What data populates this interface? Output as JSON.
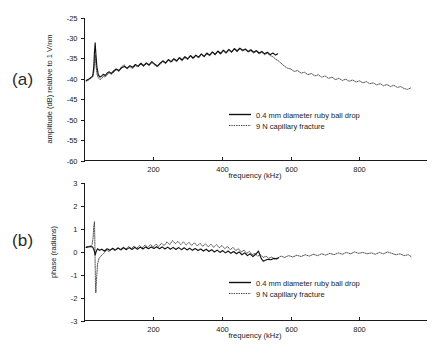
{
  "figure": {
    "panel_a_label": "(a)",
    "panel_b_label": "(b)"
  },
  "legend": {
    "series1": "0.4 mm diameter ruby ball drop",
    "series2": "9 N capillary fracture"
  },
  "chart_data": [
    {
      "type": "line",
      "panel": "(a)",
      "title": "",
      "xlabel": "frequency (kHz)",
      "ylabel": "amplitude (dB) relative to 1 V/nm",
      "xlim": [
        0,
        995
      ],
      "ylim": [
        -60,
        -25
      ],
      "xticks": [
        200,
        400,
        600,
        800
      ],
      "yticks": [
        -25,
        -30,
        -35,
        -40,
        -45,
        -50,
        -55,
        -60
      ],
      "grid": false,
      "legend_position": "lower-right",
      "series": [
        {
          "name": "0.4 mm diameter ruby ball drop",
          "style": "solid",
          "x": [
            5,
            10,
            15,
            20,
            24,
            27,
            29,
            31,
            33,
            36,
            40,
            45,
            50,
            55,
            60,
            66,
            72,
            78,
            85,
            92,
            100,
            108,
            116,
            124,
            132,
            140,
            148,
            156,
            164,
            172,
            180,
            188,
            196,
            204,
            212,
            220,
            228,
            236,
            244,
            252,
            260,
            268,
            276,
            284,
            292,
            300,
            308,
            316,
            324,
            332,
            340,
            348,
            356,
            364,
            372,
            380,
            388,
            396,
            404,
            412,
            420,
            428,
            436,
            444,
            452,
            460,
            468,
            476,
            484,
            492,
            500,
            508,
            516,
            524,
            532,
            540,
            548,
            556,
            562
          ],
          "values": [
            -40.4,
            -40.2,
            -39.9,
            -39.6,
            -39.3,
            -37.2,
            -33.5,
            -31.2,
            -33.8,
            -37.0,
            -39.0,
            -39.6,
            -39.3,
            -38.9,
            -39.2,
            -38.6,
            -38.3,
            -38.7,
            -38.1,
            -37.6,
            -38.0,
            -37.3,
            -37.0,
            -37.4,
            -36.8,
            -37.2,
            -36.5,
            -36.9,
            -36.2,
            -36.8,
            -36.1,
            -36.6,
            -35.8,
            -36.4,
            -36.9,
            -36.2,
            -35.6,
            -36.1,
            -35.3,
            -35.8,
            -35.1,
            -35.6,
            -34.8,
            -35.4,
            -34.6,
            -35.1,
            -34.3,
            -34.9,
            -34.2,
            -34.7,
            -33.9,
            -34.5,
            -33.7,
            -34.2,
            -33.4,
            -34.0,
            -33.2,
            -33.8,
            -33.0,
            -33.6,
            -32.8,
            -33.4,
            -32.6,
            -33.2,
            -32.5,
            -33.0,
            -32.7,
            -33.3,
            -32.9,
            -33.5,
            -33.1,
            -33.7,
            -33.3,
            -33.9,
            -33.5,
            -34.1,
            -33.7,
            -34.2,
            -33.9
          ]
        },
        {
          "name": "9 N capillary fracture",
          "style": "dotted",
          "x": [
            5,
            10,
            15,
            20,
            24,
            27,
            29,
            31,
            33,
            36,
            40,
            45,
            50,
            55,
            60,
            66,
            72,
            78,
            85,
            92,
            100,
            108,
            116,
            124,
            132,
            140,
            148,
            156,
            164,
            172,
            180,
            188,
            196,
            204,
            212,
            220,
            228,
            236,
            244,
            252,
            260,
            268,
            276,
            284,
            292,
            300,
            308,
            316,
            324,
            332,
            340,
            348,
            356,
            364,
            372,
            380,
            388,
            396,
            404,
            412,
            420,
            428,
            436,
            444,
            452,
            460,
            468,
            476,
            484,
            492,
            500,
            508,
            516,
            524,
            532,
            540,
            548,
            556,
            564,
            572,
            580,
            590,
            600,
            610,
            620,
            630,
            640,
            650,
            660,
            670,
            680,
            690,
            700,
            710,
            720,
            730,
            740,
            750,
            760,
            770,
            780,
            790,
            800,
            810,
            820,
            830,
            840,
            850,
            860,
            870,
            880,
            890,
            900,
            910,
            920,
            930,
            940,
            950
          ],
          "values": [
            -40.6,
            -40.4,
            -40.1,
            -39.8,
            -39.5,
            -38.4,
            -36.0,
            -34.2,
            -36.4,
            -38.6,
            -39.8,
            -40.2,
            -39.9,
            -39.4,
            -39.6,
            -39.0,
            -38.6,
            -38.9,
            -38.4,
            -37.8,
            -38.2,
            -37.0,
            -36.6,
            -37.6,
            -37.0,
            -37.5,
            -36.8,
            -37.1,
            -36.4,
            -37.0,
            -36.3,
            -36.8,
            -36.0,
            -36.6,
            -37.1,
            -36.4,
            -35.8,
            -36.3,
            -35.5,
            -36.0,
            -35.3,
            -35.8,
            -35.0,
            -35.6,
            -34.8,
            -35.3,
            -34.5,
            -35.1,
            -34.4,
            -34.9,
            -34.1,
            -34.7,
            -33.9,
            -34.4,
            -33.6,
            -34.2,
            -33.4,
            -34.0,
            -33.2,
            -33.8,
            -33.0,
            -33.6,
            -32.8,
            -33.4,
            -32.7,
            -33.2,
            -32.9,
            -33.5,
            -33.1,
            -33.7,
            -33.3,
            -33.9,
            -33.5,
            -34.1,
            -33.7,
            -34.3,
            -34.6,
            -35.2,
            -35.6,
            -36.2,
            -36.8,
            -37.4,
            -37.6,
            -38.2,
            -38.0,
            -38.6,
            -38.4,
            -39.0,
            -38.7,
            -39.3,
            -39.0,
            -39.6,
            -39.3,
            -39.9,
            -39.6,
            -40.2,
            -39.9,
            -40.4,
            -40.1,
            -40.6,
            -40.3,
            -40.8,
            -40.5,
            -41.0,
            -40.7,
            -41.2,
            -41.0,
            -41.5,
            -41.2,
            -41.7,
            -41.4,
            -41.9,
            -41.6,
            -42.1,
            -41.9,
            -42.4,
            -42.6,
            -42.2
          ]
        }
      ]
    },
    {
      "type": "line",
      "panel": "(b)",
      "title": "",
      "xlabel": "frequency (kHz)",
      "ylabel": "phase (radians)",
      "xlim": [
        0,
        995
      ],
      "ylim": [
        -3,
        3
      ],
      "xticks": [
        200,
        400,
        600,
        800
      ],
      "yticks": [
        3,
        2,
        1,
        0,
        -1,
        -2,
        -3
      ],
      "grid": false,
      "legend_position": "lower-right",
      "series": [
        {
          "name": "0.4 mm diameter ruby ball drop",
          "style": "solid",
          "x": [
            5,
            12,
            18,
            24,
            28,
            31,
            34,
            38,
            44,
            50,
            58,
            66,
            74,
            82,
            90,
            98,
            106,
            114,
            122,
            130,
            138,
            146,
            154,
            162,
            170,
            178,
            186,
            194,
            202,
            210,
            218,
            226,
            234,
            242,
            250,
            258,
            266,
            274,
            282,
            290,
            298,
            306,
            314,
            322,
            330,
            338,
            346,
            354,
            362,
            370,
            378,
            386,
            394,
            402,
            410,
            418,
            426,
            434,
            442,
            450,
            458,
            466,
            474,
            482,
            490,
            498,
            506,
            514,
            520,
            526,
            534,
            542,
            550,
            558,
            564
          ],
          "values": [
            0.18,
            0.2,
            0.22,
            0.19,
            0.05,
            -0.15,
            0.0,
            0.12,
            0.05,
            0.1,
            0.02,
            0.12,
            0.05,
            0.14,
            0.06,
            0.15,
            0.07,
            0.16,
            0.08,
            0.17,
            0.09,
            0.18,
            0.1,
            0.19,
            0.11,
            0.2,
            0.12,
            0.2,
            0.13,
            0.21,
            0.12,
            0.2,
            0.11,
            0.19,
            0.1,
            0.18,
            0.09,
            0.17,
            0.08,
            0.16,
            0.07,
            0.14,
            0.05,
            0.13,
            0.04,
            0.11,
            0.02,
            0.1,
            0.0,
            0.08,
            -0.02,
            0.06,
            -0.04,
            0.04,
            -0.06,
            0.02,
            -0.08,
            0.0,
            -0.1,
            -0.02,
            -0.14,
            -0.06,
            -0.18,
            -0.1,
            -0.22,
            -0.12,
            0.02,
            -0.3,
            -0.42,
            -0.38,
            -0.34,
            -0.36,
            -0.3,
            -0.32,
            -0.28
          ]
        },
        {
          "name": "9 N capillary fracture",
          "style": "dotted",
          "x": [
            5,
            12,
            18,
            22,
            25,
            27,
            29,
            30,
            31,
            32,
            33,
            35,
            38,
            42,
            48,
            56,
            64,
            72,
            80,
            88,
            96,
            104,
            112,
            120,
            128,
            136,
            144,
            152,
            160,
            168,
            176,
            184,
            192,
            200,
            208,
            216,
            224,
            232,
            240,
            248,
            256,
            264,
            272,
            280,
            288,
            296,
            304,
            312,
            320,
            328,
            336,
            344,
            352,
            360,
            368,
            376,
            384,
            392,
            400,
            408,
            416,
            424,
            432,
            440,
            448,
            456,
            464,
            472,
            480,
            488,
            496,
            504,
            512,
            520,
            528,
            536,
            544,
            552,
            562,
            572,
            582,
            594,
            606,
            618,
            630,
            642,
            654,
            666,
            678,
            690,
            702,
            714,
            726,
            738,
            750,
            762,
            774,
            786,
            798,
            810,
            822,
            834,
            846,
            858,
            870,
            882,
            894,
            906,
            918,
            930,
            942,
            950
          ],
          "values": [
            0.2,
            0.22,
            0.24,
            0.3,
            0.6,
            1.1,
            1.3,
            0.5,
            -0.6,
            -1.5,
            -1.8,
            -1.2,
            -0.55,
            -0.3,
            -0.2,
            -0.08,
            0.06,
            0.0,
            0.12,
            0.04,
            0.16,
            0.08,
            0.2,
            0.1,
            0.22,
            0.12,
            0.24,
            0.14,
            0.26,
            0.16,
            0.28,
            0.18,
            0.3,
            0.2,
            0.32,
            0.22,
            0.36,
            0.26,
            0.42,
            0.3,
            0.48,
            0.34,
            0.44,
            0.3,
            0.42,
            0.28,
            0.4,
            0.26,
            0.38,
            0.24,
            0.36,
            0.22,
            0.34,
            0.2,
            0.32,
            0.18,
            0.3,
            0.16,
            0.26,
            0.12,
            0.22,
            0.08,
            0.18,
            0.04,
            0.12,
            -0.02,
            0.06,
            -0.08,
            0.0,
            -0.14,
            -0.08,
            -0.2,
            -0.14,
            -0.26,
            -0.2,
            -0.3,
            -0.24,
            -0.32,
            -0.28,
            -0.2,
            -0.26,
            -0.18,
            -0.24,
            -0.16,
            -0.22,
            -0.14,
            -0.2,
            -0.12,
            -0.18,
            -0.1,
            -0.16,
            -0.08,
            -0.14,
            -0.06,
            -0.12,
            -0.04,
            -0.1,
            -0.02,
            -0.08,
            -0.04,
            -0.1,
            -0.06,
            -0.12,
            -0.04,
            -0.1,
            -0.02,
            -0.08,
            -0.14,
            -0.1,
            -0.18,
            -0.14,
            -0.22,
            -0.3,
            -0.26
          ]
        }
      ]
    }
  ]
}
